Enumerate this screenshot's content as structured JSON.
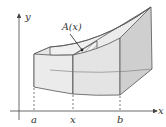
{
  "figure": {
    "type": "volume-by-cross-sections",
    "axis_labels": {
      "x": "x",
      "y": "y"
    },
    "tick_labels": {
      "a": "a",
      "x": "x",
      "b": "b"
    },
    "cross_section_label": "A(x)",
    "colors": {
      "line": "#555555",
      "face_light": "#ececec",
      "face_mid": "#dcdcdc",
      "face_dark": "#c8c8c8",
      "hatch": "#8a8a8a",
      "axis": "#444444"
    }
  }
}
